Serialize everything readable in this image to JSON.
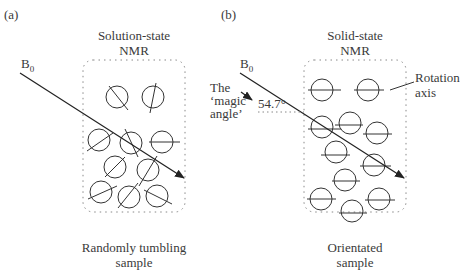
{
  "panels": [
    {
      "tag": "(a)",
      "title_line1": "Solution-state",
      "title_line2": "NMR",
      "field_label": "B",
      "field_sub": "0",
      "caption_line1": "Randomly tumbling",
      "caption_line2": "sample"
    },
    {
      "tag": "(b)",
      "title_line1": "Solid-state",
      "title_line2": "NMR",
      "field_label": "B",
      "field_sub": "0",
      "caption_line1": "Orientated",
      "caption_line2": "sample",
      "angle_label": "54.7°",
      "magic_line1": "The",
      "magic_line2": "‘magic",
      "magic_line3": "angle’",
      "axis_line1": "Rotation",
      "axis_line2": "axis"
    }
  ],
  "colors": {
    "stroke": "#333333",
    "dotted": "#888888",
    "text": "#3a3a3a"
  }
}
